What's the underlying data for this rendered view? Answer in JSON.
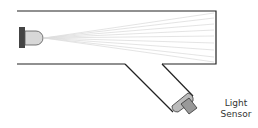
{
  "diagram": {
    "label_line1": "Light",
    "label_line2": "Sensor",
    "components": [
      "led-emitter",
      "light-beam",
      "chamber",
      "angled-tube",
      "light-sensor"
    ],
    "colors": {
      "outline": "#222222",
      "led_base": "#444444",
      "led_dome": "#d8d8d8",
      "beam": "#dcdcdc",
      "sensor": "#999999"
    }
  }
}
